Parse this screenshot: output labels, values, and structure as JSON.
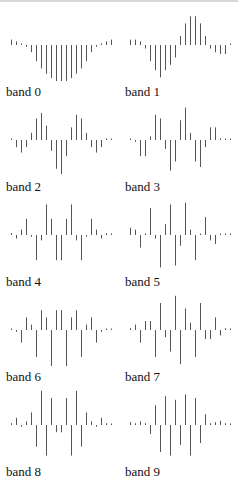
{
  "chart_data": {
    "type": "stem",
    "title": "",
    "layout": {
      "rows": 5,
      "cols": 2,
      "grid": false,
      "axes": false
    },
    "x": [
      0,
      1,
      2,
      3,
      4,
      5,
      6,
      7,
      8,
      9,
      10,
      11,
      12,
      13,
      14,
      15,
      16,
      17,
      18,
      19,
      20
    ],
    "panels": [
      {
        "label": "band 0",
        "values": [
          0.15,
          0.1,
          0,
          -0.05,
          -0.2,
          -0.45,
          -0.65,
          -0.8,
          -0.92,
          -1.0,
          -1.0,
          -1.0,
          -0.92,
          -0.8,
          -0.65,
          -0.45,
          -0.2,
          -0.05,
          0,
          0.1,
          0.15
        ]
      },
      {
        "label": "band 1",
        "values": [
          0.15,
          0.15,
          0.1,
          -0.1,
          -0.45,
          -0.7,
          -0.9,
          -0.7,
          -0.55,
          -0.35,
          0.25,
          0.6,
          0.8,
          0.8,
          0.6,
          0.25,
          -0.1,
          -0.2,
          -0.25,
          -0.25,
          0
        ]
      },
      {
        "label": "band 2",
        "values": [
          0,
          -0.2,
          -0.35,
          -0.2,
          0.2,
          0.6,
          0.75,
          0.4,
          -0.3,
          -0.8,
          -0.95,
          -0.45,
          0.35,
          0.7,
          0.6,
          0.2,
          -0.2,
          -0.35,
          -0.2,
          0,
          0
        ]
      },
      {
        "label": "band 3",
        "values": [
          0,
          -0.05,
          -0.45,
          -0.45,
          0.1,
          0.7,
          0.6,
          -0.25,
          -0.85,
          -0.6,
          0.55,
          0.9,
          0.2,
          -0.6,
          -0.75,
          -0.2,
          0.35,
          0.35,
          0.05,
          0,
          0
        ]
      },
      {
        "label": "band 4",
        "values": [
          0.05,
          -0.1,
          0.15,
          0.45,
          -0.05,
          -0.7,
          -0.15,
          0.85,
          0.45,
          -0.7,
          -0.7,
          0.45,
          0.85,
          -0.15,
          -0.7,
          -0.05,
          0.45,
          0.15,
          -0.1,
          0.05,
          0
        ]
      },
      {
        "label": "band 5",
        "values": [
          0.2,
          0.15,
          -0.35,
          0,
          0.75,
          -0.1,
          -0.9,
          0.3,
          0.85,
          -0.85,
          -0.3,
          0.9,
          0.15,
          -0.7,
          0,
          0.5,
          -0.15,
          -0.25,
          0,
          0,
          0
        ]
      },
      {
        "label": "band 6",
        "values": [
          0.02,
          -0.05,
          -0.35,
          0.35,
          0.15,
          -0.75,
          0.55,
          0.35,
          -1.0,
          0.55,
          0.55,
          -1.0,
          0.35,
          0.55,
          -0.75,
          0.15,
          0.35,
          -0.35,
          -0.05,
          0.02,
          0
        ]
      },
      {
        "label": "band 7",
        "values": [
          0.05,
          0.15,
          -0.35,
          0.25,
          0.25,
          -0.75,
          0.75,
          -0.2,
          -0.6,
          0.95,
          -0.95,
          0.6,
          0.2,
          -0.75,
          0.75,
          -0.25,
          -0.25,
          0.35,
          -0.15,
          0.05,
          0
        ]
      },
      {
        "label": "band 8",
        "values": [
          0.05,
          0.2,
          -0.05,
          0.1,
          0.35,
          -0.6,
          0.95,
          -0.85,
          0.75,
          -0.2,
          -0.2,
          0.75,
          -0.85,
          0.95,
          -0.6,
          0.35,
          0.1,
          -0.05,
          0.2,
          0.05,
          0
        ]
      },
      {
        "label": "band 9",
        "values": [
          0.08,
          0.05,
          0.1,
          0.05,
          -0.25,
          0.55,
          -0.75,
          0.8,
          -0.85,
          0.7,
          -0.55,
          0.85,
          -0.85,
          0.75,
          -0.5,
          0.3,
          0.05,
          0.08,
          0.12,
          0.05,
          0
        ]
      }
    ]
  },
  "style": {
    "stem_color": "#555555",
    "label_color": "#111111",
    "background": "#ffffff"
  }
}
